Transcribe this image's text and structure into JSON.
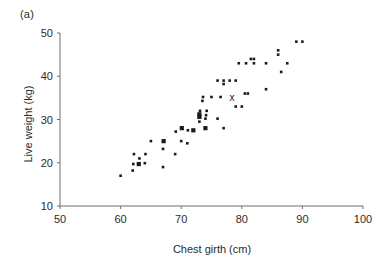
{
  "figure": {
    "panel_label": "(a)",
    "axis_color": "#6e6e6e",
    "point_color": "#1a1a1a"
  },
  "chart_data": {
    "type": "scatter",
    "title": "",
    "subtitle": "",
    "panel": "(a)",
    "xlabel": "Chest girth (cm)",
    "ylabel": "Live weight (kg)",
    "xlim": [
      50,
      100
    ],
    "ylim": [
      10,
      50
    ],
    "xticks": [
      50,
      60,
      70,
      80,
      90,
      100
    ],
    "yticks": [
      10,
      20,
      30,
      40,
      50
    ],
    "grid": false,
    "legend": null,
    "annotations": [
      {
        "text": "x",
        "x": 78.4,
        "y": 35.2,
        "note": "cross marker highlighting one individual"
      }
    ],
    "series": [
      {
        "name": "individual animals",
        "marker": "filled-square",
        "color": "#1a1a1a",
        "points": [
          {
            "x": 60.0,
            "y": 17.0,
            "size": 1
          },
          {
            "x": 62.0,
            "y": 18.2,
            "size": 1
          },
          {
            "x": 62.1,
            "y": 19.7,
            "size": 1
          },
          {
            "x": 62.2,
            "y": 22.0,
            "size": 1
          },
          {
            "x": 63.0,
            "y": 19.7,
            "size": 2
          },
          {
            "x": 63.1,
            "y": 21.0,
            "size": 1
          },
          {
            "x": 64.0,
            "y": 19.9,
            "size": 1
          },
          {
            "x": 64.1,
            "y": 22.0,
            "size": 1
          },
          {
            "x": 65.0,
            "y": 25.0,
            "size": 1
          },
          {
            "x": 67.0,
            "y": 19.0,
            "size": 1
          },
          {
            "x": 67.0,
            "y": 23.2,
            "size": 1
          },
          {
            "x": 67.1,
            "y": 25.0,
            "size": 2
          },
          {
            "x": 69.0,
            "y": 22.0,
            "size": 1
          },
          {
            "x": 69.1,
            "y": 27.2,
            "size": 1
          },
          {
            "x": 70.0,
            "y": 25.0,
            "size": 1
          },
          {
            "x": 70.1,
            "y": 28.0,
            "size": 2
          },
          {
            "x": 71.0,
            "y": 24.5,
            "size": 1
          },
          {
            "x": 71.1,
            "y": 27.5,
            "size": 1
          },
          {
            "x": 72.0,
            "y": 27.5,
            "size": 2
          },
          {
            "x": 73.0,
            "y": 29.5,
            "size": 1
          },
          {
            "x": 73.0,
            "y": 30.6,
            "size": 2
          },
          {
            "x": 73.0,
            "y": 31.2,
            "size": 2
          },
          {
            "x": 73.1,
            "y": 32.0,
            "size": 1
          },
          {
            "x": 73.5,
            "y": 34.3,
            "size": 1
          },
          {
            "x": 73.6,
            "y": 35.2,
            "size": 1
          },
          {
            "x": 74.0,
            "y": 28.0,
            "size": 2
          },
          {
            "x": 74.0,
            "y": 30.2,
            "size": 1
          },
          {
            "x": 74.1,
            "y": 31.0,
            "size": 1
          },
          {
            "x": 74.2,
            "y": 32.0,
            "size": 1
          },
          {
            "x": 75.0,
            "y": 35.2,
            "size": 1
          },
          {
            "x": 76.0,
            "y": 30.2,
            "size": 1
          },
          {
            "x": 76.0,
            "y": 39.0,
            "size": 1
          },
          {
            "x": 76.5,
            "y": 35.2,
            "size": 1
          },
          {
            "x": 77.0,
            "y": 28.0,
            "size": 1
          },
          {
            "x": 77.0,
            "y": 38.2,
            "size": 1
          },
          {
            "x": 77.0,
            "y": 39.0,
            "size": 1
          },
          {
            "x": 78.0,
            "y": 39.0,
            "size": 1
          },
          {
            "x": 79.0,
            "y": 33.0,
            "size": 1
          },
          {
            "x": 79.0,
            "y": 39.0,
            "size": 1
          },
          {
            "x": 79.5,
            "y": 43.0,
            "size": 1
          },
          {
            "x": 80.0,
            "y": 33.0,
            "size": 1
          },
          {
            "x": 80.5,
            "y": 36.0,
            "size": 1
          },
          {
            "x": 80.7,
            "y": 43.0,
            "size": 1
          },
          {
            "x": 81.0,
            "y": 36.0,
            "size": 1
          },
          {
            "x": 81.5,
            "y": 44.0,
            "size": 1
          },
          {
            "x": 82.0,
            "y": 43.0,
            "size": 1
          },
          {
            "x": 82.0,
            "y": 44.0,
            "size": 1
          },
          {
            "x": 84.0,
            "y": 37.0,
            "size": 1
          },
          {
            "x": 84.0,
            "y": 43.0,
            "size": 1
          },
          {
            "x": 86.0,
            "y": 45.0,
            "size": 1
          },
          {
            "x": 86.0,
            "y": 46.0,
            "size": 1
          },
          {
            "x": 86.5,
            "y": 41.0,
            "size": 1
          },
          {
            "x": 87.5,
            "y": 43.0,
            "size": 1
          },
          {
            "x": 89.0,
            "y": 48.0,
            "size": 1
          },
          {
            "x": 90.0,
            "y": 48.0,
            "size": 1
          }
        ]
      }
    ]
  }
}
